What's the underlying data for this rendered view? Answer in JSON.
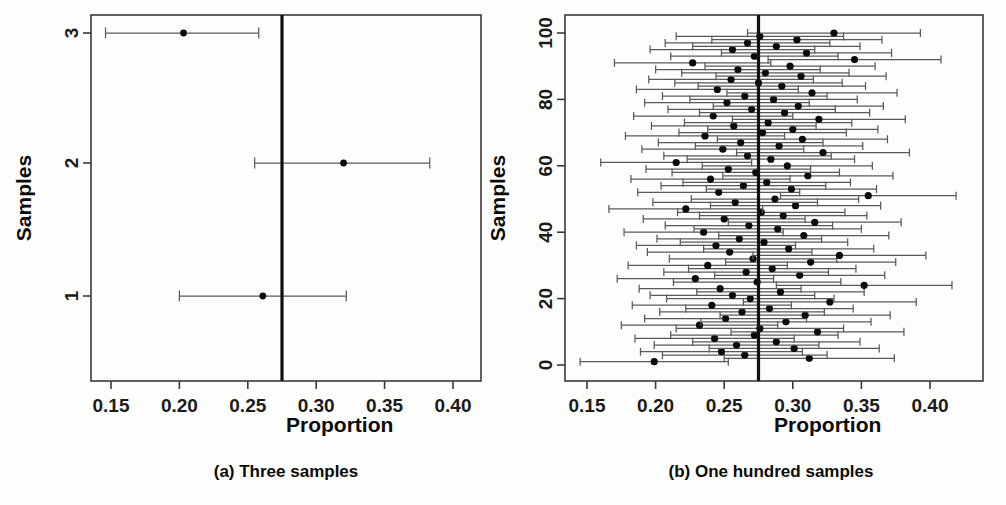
{
  "figure": {
    "background": "#fdfdfb",
    "ink": "#111111",
    "ci_color": "#5a5a5a"
  },
  "panels": [
    {
      "key": "a",
      "caption": "(a) Three samples",
      "xlabel": "Proportion",
      "ylabel": "Samples",
      "xticks": [
        "0.15",
        "0.20",
        "0.25",
        "0.30",
        "0.35",
        "0.40"
      ],
      "yticks": [
        "1",
        "2",
        "3"
      ]
    },
    {
      "key": "b",
      "caption": "(b) One hundred samples",
      "xlabel": "Proportion",
      "ylabel": "Samples",
      "xticks": [
        "0.15",
        "0.20",
        "0.25",
        "0.30",
        "0.35",
        "0.40"
      ],
      "yticks": [
        "0",
        "20",
        "40",
        "60",
        "80",
        "100"
      ]
    }
  ],
  "chart_data": [
    {
      "type": "scatter",
      "panel": "a",
      "title": "(a) Three samples",
      "xlabel": "Proportion",
      "ylabel": "Samples",
      "xlim": [
        0.1364,
        0.4227
      ],
      "ylim": [
        0.5,
        3.5
      ],
      "xticks": [
        0.15,
        0.2,
        0.25,
        0.3,
        0.35,
        0.4
      ],
      "yticks": [
        1,
        2,
        3
      ],
      "grid": false,
      "legend": "none",
      "reference_line": {
        "x": 0.275,
        "label": "true population proportion"
      },
      "series": [
        {
          "name": "sample estimates with 95% confidence intervals",
          "points": [
            {
              "sample": 1,
              "estimate": 0.261,
              "ci_low": 0.2,
              "ci_high": 0.322,
              "covers_reference": true
            },
            {
              "sample": 2,
              "estimate": 0.32,
              "ci_low": 0.255,
              "ci_high": 0.383,
              "covers_reference": true
            },
            {
              "sample": 3,
              "estimate": 0.203,
              "ci_low": 0.146,
              "ci_high": 0.258,
              "covers_reference": false
            }
          ]
        }
      ]
    },
    {
      "type": "scatter",
      "panel": "b",
      "title": "(b) One hundred samples",
      "xlabel": "Proportion",
      "ylabel": "Samples",
      "xlim": [
        0.1364,
        0.4227
      ],
      "ylim": [
        0,
        101
      ],
      "xticks": [
        0.15,
        0.2,
        0.25,
        0.3,
        0.35,
        0.4
      ],
      "yticks": [
        0,
        20,
        40,
        60,
        80,
        100
      ],
      "grid": false,
      "legend": "none",
      "reference_line": {
        "x": 0.275,
        "label": "true population proportion"
      },
      "series": [
        {
          "name": "sample estimates with 95% confidence intervals",
          "points": [
            {
              "sample": 1,
              "estimate": 0.199,
              "ci_low": 0.145,
              "ci_high": 0.253
            },
            {
              "sample": 2,
              "estimate": 0.312,
              "ci_low": 0.25,
              "ci_high": 0.374
            },
            {
              "sample": 3,
              "estimate": 0.265,
              "ci_low": 0.205,
              "ci_high": 0.325
            },
            {
              "sample": 4,
              "estimate": 0.248,
              "ci_low": 0.189,
              "ci_high": 0.307
            },
            {
              "sample": 5,
              "estimate": 0.301,
              "ci_low": 0.239,
              "ci_high": 0.363
            },
            {
              "sample": 6,
              "estimate": 0.259,
              "ci_low": 0.199,
              "ci_high": 0.319
            },
            {
              "sample": 7,
              "estimate": 0.288,
              "ci_low": 0.227,
              "ci_high": 0.349
            },
            {
              "sample": 8,
              "estimate": 0.243,
              "ci_low": 0.185,
              "ci_high": 0.301
            },
            {
              "sample": 9,
              "estimate": 0.272,
              "ci_low": 0.211,
              "ci_high": 0.333
            },
            {
              "sample": 10,
              "estimate": 0.318,
              "ci_low": 0.255,
              "ci_high": 0.381
            },
            {
              "sample": 11,
              "estimate": 0.276,
              "ci_low": 0.215,
              "ci_high": 0.337
            },
            {
              "sample": 12,
              "estimate": 0.232,
              "ci_low": 0.175,
              "ci_high": 0.289
            },
            {
              "sample": 13,
              "estimate": 0.295,
              "ci_low": 0.233,
              "ci_high": 0.357
            },
            {
              "sample": 14,
              "estimate": 0.251,
              "ci_low": 0.192,
              "ci_high": 0.31
            },
            {
              "sample": 15,
              "estimate": 0.309,
              "ci_low": 0.247,
              "ci_high": 0.371
            },
            {
              "sample": 16,
              "estimate": 0.263,
              "ci_low": 0.203,
              "ci_high": 0.323
            },
            {
              "sample": 17,
              "estimate": 0.283,
              "ci_low": 0.222,
              "ci_high": 0.344
            },
            {
              "sample": 18,
              "estimate": 0.241,
              "ci_low": 0.183,
              "ci_high": 0.299
            },
            {
              "sample": 19,
              "estimate": 0.327,
              "ci_low": 0.264,
              "ci_high": 0.39
            },
            {
              "sample": 20,
              "estimate": 0.269,
              "ci_low": 0.208,
              "ci_high": 0.33
            },
            {
              "sample": 21,
              "estimate": 0.256,
              "ci_low": 0.196,
              "ci_high": 0.316
            },
            {
              "sample": 22,
              "estimate": 0.291,
              "ci_low": 0.23,
              "ci_high": 0.352
            },
            {
              "sample": 23,
              "estimate": 0.247,
              "ci_low": 0.188,
              "ci_high": 0.306
            },
            {
              "sample": 24,
              "estimate": 0.352,
              "ci_low": 0.288,
              "ci_high": 0.416
            },
            {
              "sample": 25,
              "estimate": 0.274,
              "ci_low": 0.213,
              "ci_high": 0.335
            },
            {
              "sample": 26,
              "estimate": 0.229,
              "ci_low": 0.172,
              "ci_high": 0.286
            },
            {
              "sample": 27,
              "estimate": 0.305,
              "ci_low": 0.243,
              "ci_high": 0.367
            },
            {
              "sample": 28,
              "estimate": 0.266,
              "ci_low": 0.206,
              "ci_high": 0.326
            },
            {
              "sample": 29,
              "estimate": 0.285,
              "ci_low": 0.224,
              "ci_high": 0.346
            },
            {
              "sample": 30,
              "estimate": 0.238,
              "ci_low": 0.18,
              "ci_high": 0.296
            },
            {
              "sample": 31,
              "estimate": 0.313,
              "ci_low": 0.251,
              "ci_high": 0.375
            },
            {
              "sample": 32,
              "estimate": 0.271,
              "ci_low": 0.21,
              "ci_high": 0.332
            },
            {
              "sample": 33,
              "estimate": 0.334,
              "ci_low": 0.271,
              "ci_high": 0.397
            },
            {
              "sample": 34,
              "estimate": 0.254,
              "ci_low": 0.194,
              "ci_high": 0.314
            },
            {
              "sample": 35,
              "estimate": 0.297,
              "ci_low": 0.235,
              "ci_high": 0.359
            },
            {
              "sample": 36,
              "estimate": 0.244,
              "ci_low": 0.186,
              "ci_high": 0.302
            },
            {
              "sample": 37,
              "estimate": 0.279,
              "ci_low": 0.218,
              "ci_high": 0.34
            },
            {
              "sample": 38,
              "estimate": 0.261,
              "ci_low": 0.201,
              "ci_high": 0.321
            },
            {
              "sample": 39,
              "estimate": 0.308,
              "ci_low": 0.246,
              "ci_high": 0.37
            },
            {
              "sample": 40,
              "estimate": 0.235,
              "ci_low": 0.177,
              "ci_high": 0.293
            },
            {
              "sample": 41,
              "estimate": 0.289,
              "ci_low": 0.228,
              "ci_high": 0.35
            },
            {
              "sample": 42,
              "estimate": 0.268,
              "ci_low": 0.207,
              "ci_high": 0.329
            },
            {
              "sample": 43,
              "estimate": 0.316,
              "ci_low": 0.253,
              "ci_high": 0.379
            },
            {
              "sample": 44,
              "estimate": 0.25,
              "ci_low": 0.191,
              "ci_high": 0.309
            },
            {
              "sample": 45,
              "estimate": 0.293,
              "ci_low": 0.232,
              "ci_high": 0.354
            },
            {
              "sample": 46,
              "estimate": 0.277,
              "ci_low": 0.216,
              "ci_high": 0.338
            },
            {
              "sample": 47,
              "estimate": 0.222,
              "ci_low": 0.166,
              "ci_high": 0.278
            },
            {
              "sample": 48,
              "estimate": 0.302,
              "ci_low": 0.24,
              "ci_high": 0.364
            },
            {
              "sample": 49,
              "estimate": 0.258,
              "ci_low": 0.198,
              "ci_high": 0.318
            },
            {
              "sample": 50,
              "estimate": 0.287,
              "ci_low": 0.226,
              "ci_high": 0.348
            },
            {
              "sample": 51,
              "estimate": 0.355,
              "ci_low": 0.291,
              "ci_high": 0.419
            },
            {
              "sample": 52,
              "estimate": 0.246,
              "ci_low": 0.187,
              "ci_high": 0.305
            },
            {
              "sample": 53,
              "estimate": 0.299,
              "ci_low": 0.237,
              "ci_high": 0.361
            },
            {
              "sample": 54,
              "estimate": 0.264,
              "ci_low": 0.204,
              "ci_high": 0.324
            },
            {
              "sample": 55,
              "estimate": 0.281,
              "ci_low": 0.22,
              "ci_high": 0.342
            },
            {
              "sample": 56,
              "estimate": 0.24,
              "ci_low": 0.182,
              "ci_high": 0.298
            },
            {
              "sample": 57,
              "estimate": 0.311,
              "ci_low": 0.249,
              "ci_high": 0.373
            },
            {
              "sample": 58,
              "estimate": 0.273,
              "ci_low": 0.212,
              "ci_high": 0.334
            },
            {
              "sample": 59,
              "estimate": 0.253,
              "ci_low": 0.193,
              "ci_high": 0.313
            },
            {
              "sample": 60,
              "estimate": 0.296,
              "ci_low": 0.234,
              "ci_high": 0.358
            },
            {
              "sample": 61,
              "estimate": 0.215,
              "ci_low": 0.16,
              "ci_high": 0.27
            },
            {
              "sample": 62,
              "estimate": 0.284,
              "ci_low": 0.223,
              "ci_high": 0.345
            },
            {
              "sample": 63,
              "estimate": 0.267,
              "ci_low": 0.206,
              "ci_high": 0.328
            },
            {
              "sample": 64,
              "estimate": 0.322,
              "ci_low": 0.259,
              "ci_high": 0.385
            },
            {
              "sample": 65,
              "estimate": 0.249,
              "ci_low": 0.19,
              "ci_high": 0.308
            },
            {
              "sample": 66,
              "estimate": 0.29,
              "ci_low": 0.229,
              "ci_high": 0.351
            },
            {
              "sample": 67,
              "estimate": 0.262,
              "ci_low": 0.202,
              "ci_high": 0.322
            },
            {
              "sample": 68,
              "estimate": 0.307,
              "ci_low": 0.245,
              "ci_high": 0.369
            },
            {
              "sample": 69,
              "estimate": 0.236,
              "ci_low": 0.178,
              "ci_high": 0.294
            },
            {
              "sample": 70,
              "estimate": 0.278,
              "ci_low": 0.217,
              "ci_high": 0.339
            },
            {
              "sample": 71,
              "estimate": 0.3,
              "ci_low": 0.238,
              "ci_high": 0.362
            },
            {
              "sample": 72,
              "estimate": 0.257,
              "ci_low": 0.197,
              "ci_high": 0.317
            },
            {
              "sample": 73,
              "estimate": 0.282,
              "ci_low": 0.221,
              "ci_high": 0.343
            },
            {
              "sample": 74,
              "estimate": 0.319,
              "ci_low": 0.256,
              "ci_high": 0.382
            },
            {
              "sample": 75,
              "estimate": 0.242,
              "ci_low": 0.184,
              "ci_high": 0.3
            },
            {
              "sample": 76,
              "estimate": 0.294,
              "ci_low": 0.232,
              "ci_high": 0.356
            },
            {
              "sample": 77,
              "estimate": 0.27,
              "ci_low": 0.209,
              "ci_high": 0.331
            },
            {
              "sample": 78,
              "estimate": 0.304,
              "ci_low": 0.242,
              "ci_high": 0.366
            },
            {
              "sample": 79,
              "estimate": 0.252,
              "ci_low": 0.192,
              "ci_high": 0.312
            },
            {
              "sample": 80,
              "estimate": 0.286,
              "ci_low": 0.225,
              "ci_high": 0.347
            },
            {
              "sample": 81,
              "estimate": 0.265,
              "ci_low": 0.205,
              "ci_high": 0.325
            },
            {
              "sample": 82,
              "estimate": 0.314,
              "ci_low": 0.252,
              "ci_high": 0.376
            },
            {
              "sample": 83,
              "estimate": 0.245,
              "ci_low": 0.186,
              "ci_high": 0.304
            },
            {
              "sample": 84,
              "estimate": 0.292,
              "ci_low": 0.231,
              "ci_high": 0.353
            },
            {
              "sample": 85,
              "estimate": 0.275,
              "ci_low": 0.214,
              "ci_high": 0.336
            },
            {
              "sample": 86,
              "estimate": 0.255,
              "ci_low": 0.195,
              "ci_high": 0.315
            },
            {
              "sample": 87,
              "estimate": 0.306,
              "ci_low": 0.244,
              "ci_high": 0.368
            },
            {
              "sample": 88,
              "estimate": 0.28,
              "ci_low": 0.219,
              "ci_high": 0.341
            },
            {
              "sample": 89,
              "estimate": 0.26,
              "ci_low": 0.2,
              "ci_high": 0.32
            },
            {
              "sample": 90,
              "estimate": 0.298,
              "ci_low": 0.236,
              "ci_high": 0.36
            },
            {
              "sample": 91,
              "estimate": 0.227,
              "ci_low": 0.17,
              "ci_high": 0.284
            },
            {
              "sample": 92,
              "estimate": 0.345,
              "ci_low": 0.282,
              "ci_high": 0.408
            },
            {
              "sample": 93,
              "estimate": 0.272,
              "ci_low": 0.211,
              "ci_high": 0.333
            },
            {
              "sample": 94,
              "estimate": 0.31,
              "ci_low": 0.248,
              "ci_high": 0.372
            },
            {
              "sample": 95,
              "estimate": 0.256,
              "ci_low": 0.196,
              "ci_high": 0.316
            },
            {
              "sample": 96,
              "estimate": 0.288,
              "ci_low": 0.227,
              "ci_high": 0.349
            },
            {
              "sample": 97,
              "estimate": 0.267,
              "ci_low": 0.207,
              "ci_high": 0.327
            },
            {
              "sample": 98,
              "estimate": 0.303,
              "ci_low": 0.241,
              "ci_high": 0.365
            },
            {
              "sample": 99,
              "estimate": 0.276,
              "ci_low": 0.215,
              "ci_high": 0.337
            },
            {
              "sample": 100,
              "estimate": 0.33,
              "ci_low": 0.267,
              "ci_high": 0.393
            }
          ]
        }
      ]
    }
  ]
}
